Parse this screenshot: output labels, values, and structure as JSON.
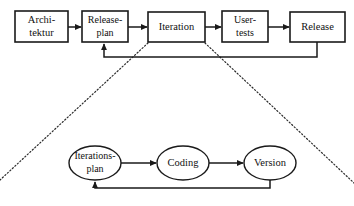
{
  "diagram": {
    "background_color": "#ffffff",
    "line_color": "#1a1a1a",
    "expansion_line_color": "#2b2b2b",
    "top_level": {
      "name": "release-process-chain",
      "nodes": [
        {
          "id": "architektur",
          "shape": "rectangle",
          "lines": [
            "Archi-",
            "tektur"
          ],
          "x": 15,
          "y": 11,
          "w": 53,
          "h": 31
        },
        {
          "id": "releaseplan",
          "shape": "rectangle",
          "lines": [
            "Release-",
            "plan"
          ],
          "x": 82,
          "y": 11,
          "w": 46,
          "h": 31
        },
        {
          "id": "iteration",
          "shape": "rectangle",
          "lines": [
            "Iteration"
          ],
          "x": 148,
          "y": 12,
          "w": 57,
          "h": 30
        },
        {
          "id": "usertests",
          "shape": "rectangle",
          "lines": [
            "User-",
            "tests"
          ],
          "x": 222,
          "y": 11,
          "w": 46,
          "h": 31
        },
        {
          "id": "release",
          "shape": "rectangle",
          "lines": [
            "Release"
          ],
          "x": 290,
          "y": 12,
          "w": 55,
          "h": 30
        }
      ],
      "arrows": [
        {
          "from": "architektur",
          "to": "releaseplan"
        },
        {
          "from": "releaseplan",
          "to": "iteration"
        },
        {
          "from": "iteration",
          "to": "usertests"
        },
        {
          "from": "usertests",
          "to": "release"
        }
      ],
      "feedback_loop": {
        "from": "release",
        "to": "releaseplan",
        "label": ""
      }
    },
    "detail_level": {
      "name": "iteration-detail-chain",
      "nodes": [
        {
          "id": "iterationsplan",
          "shape": "ellipse",
          "lines": [
            "Iterations-",
            "plan"
          ],
          "cx": 95,
          "cy": 163,
          "rx": 26,
          "ry": 17
        },
        {
          "id": "coding",
          "shape": "ellipse",
          "lines": [
            "Coding"
          ],
          "cx": 183,
          "cy": 163,
          "rx": 26,
          "ry": 17
        },
        {
          "id": "version",
          "shape": "ellipse",
          "lines": [
            "Version"
          ],
          "cx": 270,
          "cy": 163,
          "rx": 26,
          "ry": 17
        }
      ],
      "arrows": [
        {
          "from": "iterationsplan",
          "to": "coding"
        },
        {
          "from": "coding",
          "to": "version"
        }
      ],
      "feedback_loop": {
        "from": "version",
        "to": "iterationsplan",
        "label": ""
      }
    },
    "expansion": {
      "source_node": "iteration",
      "left_line": {
        "x1": 148,
        "y1": 43,
        "x2": 0,
        "y2": 180
      },
      "right_line": {
        "x1": 205,
        "y1": 43,
        "x2": 354,
        "y2": 183
      }
    }
  }
}
